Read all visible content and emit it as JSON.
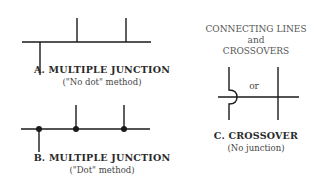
{
  "header": {
    "line1": "CONNECTING LINES",
    "line2": "and",
    "line3": "CROSSOVERS"
  },
  "diagram_a": {
    "title": "A. MULTIPLE JUNCTION",
    "subtitle": "(\"No dot\" method)"
  },
  "diagram_b": {
    "title": "B. MULTIPLE JUNCTION",
    "subtitle": "(\"Dot\" method)"
  },
  "diagram_c": {
    "or_label": "or",
    "title": "C. CROSSOVER",
    "subtitle": "(No junction)"
  },
  "colors": {
    "line": "#1a1a1a",
    "text": "#2a2a2a",
    "background": "#ffffff"
  }
}
